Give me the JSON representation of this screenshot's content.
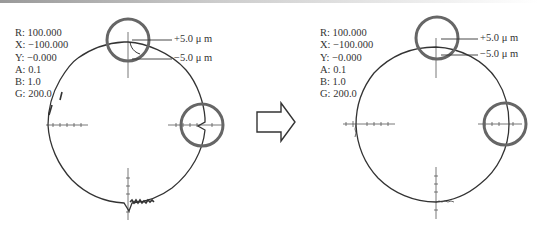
{
  "panels": [
    {
      "id": "before",
      "params": [
        {
          "key": "R",
          "label": "R: 100.000"
        },
        {
          "key": "X",
          "label": "X: −100.000"
        },
        {
          "key": "Y",
          "label": "Y: −0.000"
        },
        {
          "key": "A",
          "label": "A: 0.1"
        },
        {
          "key": "B",
          "label": "B: 1.0"
        },
        {
          "key": "G",
          "label": "G: 200.0"
        }
      ],
      "scale_plus": "+5.0 μ m",
      "scale_minus": "−5.0 μ m",
      "highlights": [
        "top-notch",
        "right-notch"
      ]
    },
    {
      "id": "after",
      "params": [
        {
          "key": "R",
          "label": "R: 100.000"
        },
        {
          "key": "X",
          "label": "X: −100.000"
        },
        {
          "key": "Y",
          "label": "Y: −0.000"
        },
        {
          "key": "A",
          "label": "A: 0.1"
        },
        {
          "key": "B",
          "label": "B: 1.0"
        },
        {
          "key": "G",
          "label": "G: 200.0"
        }
      ],
      "scale_plus": "+5.0 μ m",
      "scale_minus": "−5.0 μ m",
      "highlights": [
        "top",
        "right"
      ]
    }
  ],
  "arrow": {
    "icon": "right-arrow-outline-icon",
    "meaning": "before-to-after"
  },
  "colors": {
    "trace": "#333333",
    "highlight_circle": "#666666",
    "axis": "#555555"
  }
}
